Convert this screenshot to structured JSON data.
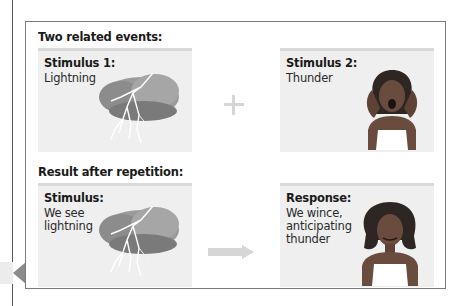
{
  "diagram": {
    "sections": [
      {
        "label": "Two related events:"
      },
      {
        "label": "Result after repetition:"
      }
    ],
    "boxes": [
      {
        "title": "Stimulus 1:",
        "text": "Lightning",
        "illustration": "lightning-cloud"
      },
      {
        "title": "Stimulus 2:",
        "text": "Thunder",
        "illustration": "woman-covering-ears-screaming"
      },
      {
        "title": "Stimulus:",
        "text": "We see\nlightning",
        "illustration": "lightning-cloud"
      },
      {
        "title": "Response:",
        "text": "We wince,\nanticipating\nthunder",
        "illustration": "woman-wincing"
      }
    ],
    "connectors": [
      {
        "type": "plus-icon",
        "color": "#d6d6d6"
      },
      {
        "type": "arrow-right-icon",
        "color": "#d6d6d6"
      }
    ],
    "colors": {
      "frame_border": "#7b7b7b",
      "box_fill": "#efefef",
      "box_top_border": "#d9d9d9",
      "side_tab_arrow": "#8a8a8a"
    }
  }
}
